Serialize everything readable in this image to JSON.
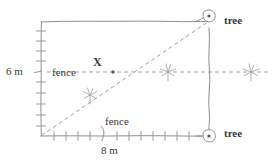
{
  "diagram": {
    "stroke_color": "#8a8a8a",
    "text_color": "#3a3a3a",
    "labels": {
      "height": "6 m",
      "width": "8 m",
      "fence_left": "fence",
      "fence_bottom": "fence",
      "point": "X",
      "tree_top": "tree",
      "tree_bottom": "tree"
    },
    "geometry": {
      "plot_left": 41,
      "plot_right": 209,
      "plot_top": 22,
      "plot_bottom": 136,
      "point_x": 113,
      "point_y": 72,
      "midline_y": 72
    },
    "markers": {
      "tree_count": 2,
      "plant_count": 3
    }
  }
}
